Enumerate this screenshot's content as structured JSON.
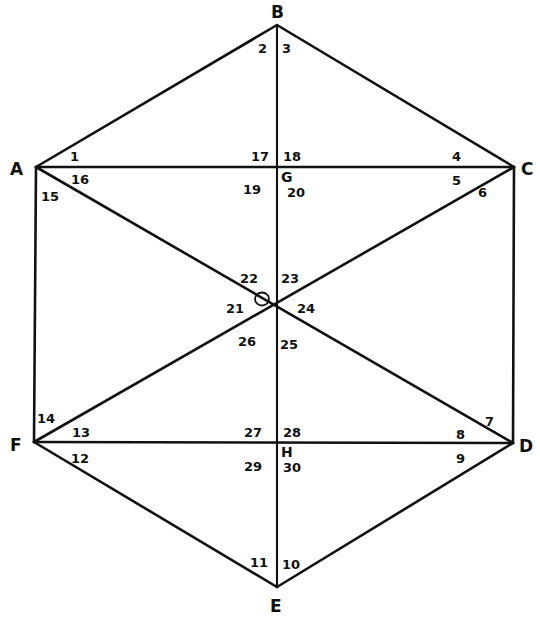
{
  "diagram": {
    "type": "hexagon-angle-figure",
    "vertices": {
      "A": {
        "label": "A",
        "x": 36,
        "y": 167
      },
      "B": {
        "label": "B",
        "x": 277,
        "y": 25
      },
      "C": {
        "label": "C",
        "x": 514,
        "y": 167
      },
      "D": {
        "label": "D",
        "x": 513,
        "y": 443
      },
      "E": {
        "label": "E",
        "x": 277,
        "y": 587
      },
      "F": {
        "label": "F",
        "x": 34,
        "y": 442
      }
    },
    "interior_points": {
      "G": {
        "label": "G",
        "x": 277,
        "y": 167
      },
      "H": {
        "label": "H",
        "x": 277,
        "y": 442
      },
      "O": {
        "label": "",
        "x": 277,
        "y": 307
      }
    },
    "segments": [
      [
        "A",
        "B"
      ],
      [
        "B",
        "C"
      ],
      [
        "C",
        "D"
      ],
      [
        "D",
        "E"
      ],
      [
        "E",
        "F"
      ],
      [
        "F",
        "A"
      ],
      [
        "A",
        "C"
      ],
      [
        "F",
        "D"
      ],
      [
        "B",
        "E"
      ],
      [
        "A",
        "D"
      ],
      [
        "C",
        "F"
      ]
    ],
    "marked_angle": {
      "number": "21",
      "note": "small circle marks angle 21 at center"
    },
    "angle_numbers": {
      "n1": "1",
      "n2": "2",
      "n3": "3",
      "n4": "4",
      "n5": "5",
      "n6": "6",
      "n7": "7",
      "n8": "8",
      "n9": "9",
      "n10": "10",
      "n11": "11",
      "n12": "12",
      "n13": "13",
      "n14": "14",
      "n15": "15",
      "n16": "16",
      "n17": "17",
      "n18": "18",
      "n19": "19",
      "n20": "20",
      "n21": "21",
      "n22": "22",
      "n23": "23",
      "n24": "24",
      "n25": "25",
      "n26": "26",
      "n27": "27",
      "n28": "28",
      "n29": "29",
      "n30": "30"
    },
    "colors": {
      "stroke": "#111111",
      "background": "#ffffff"
    }
  }
}
